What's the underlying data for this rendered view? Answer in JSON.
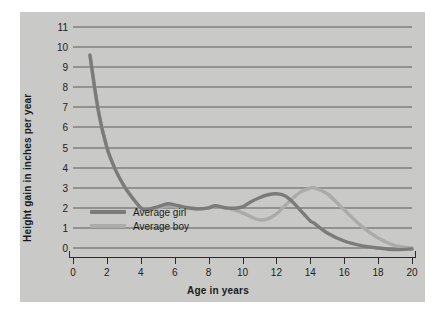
{
  "credit": "© Cengage Learning®",
  "axes": {
    "ylabel": "Height gain in inches per year",
    "xlabel": "Age in years",
    "yticks": [
      "11",
      "10",
      "9",
      "8",
      "7",
      "6",
      "5",
      "4",
      "3",
      "2",
      "1",
      "0"
    ],
    "xticks": [
      "0",
      "2",
      "4",
      "6",
      "8",
      "10",
      "12",
      "14",
      "16",
      "18",
      "20"
    ]
  },
  "legend": {
    "items": [
      {
        "label": "Average girl",
        "color": "#7b7b7b"
      },
      {
        "label": "Average boy",
        "color": "#ababab"
      }
    ]
  },
  "colors": {
    "panel": "#c9c9c7",
    "gridline": "#5d5d5d",
    "axis": "#2b2b2b",
    "girl": "#7b7b7b",
    "boy": "#ababab"
  },
  "chart_data": {
    "type": "line",
    "title": "",
    "xlabel": "Age in years",
    "ylabel": "Height gain in inches per year",
    "xlim": [
      0,
      20
    ],
    "ylim": [
      0,
      11
    ],
    "grid": true,
    "legend_position": "inside-lower-left",
    "x": [
      1,
      1.5,
      2,
      2.5,
      3,
      3.5,
      4,
      4.3,
      5,
      5.6,
      6,
      6.5,
      7,
      7.5,
      8,
      8.4,
      9,
      9.5,
      10,
      10.5,
      11,
      11.5,
      12,
      12.5,
      13,
      13.5,
      14,
      14.2,
      15,
      16,
      17,
      18,
      19,
      20
    ],
    "series": [
      {
        "name": "Average girl",
        "color": "#7b7b7b",
        "values": [
          9.6,
          6.8,
          5.0,
          3.9,
          3.1,
          2.5,
          2.0,
          1.9,
          2.05,
          2.2,
          2.15,
          2.05,
          1.98,
          1.95,
          2.0,
          2.1,
          2.0,
          1.98,
          2.05,
          2.3,
          2.5,
          2.65,
          2.7,
          2.6,
          2.25,
          1.8,
          1.35,
          1.25,
          0.75,
          0.35,
          0.12,
          0.0,
          -0.08,
          -0.05
        ]
      },
      {
        "name": "Average boy",
        "color": "#ababab",
        "values": [
          9.6,
          6.8,
          5.0,
          3.9,
          3.1,
          2.5,
          2.0,
          1.92,
          2.0,
          2.1,
          2.08,
          2.0,
          1.95,
          1.95,
          2.0,
          2.05,
          2.0,
          1.9,
          1.75,
          1.55,
          1.4,
          1.45,
          1.7,
          2.1,
          2.5,
          2.82,
          2.98,
          3.0,
          2.7,
          1.9,
          1.1,
          0.5,
          0.12,
          0.0
        ]
      }
    ],
    "annotations": [
      "Girl's growth spurt peaks at about 2.7 in/yr near age 12",
      "Boy's growth spurt peaks at about 3.0 in/yr near age 14"
    ]
  }
}
